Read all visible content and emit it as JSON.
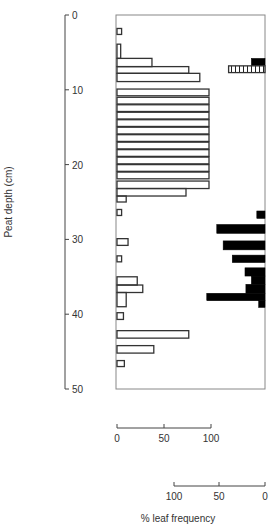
{
  "chart_data": {
    "type": "bar",
    "orientation": "horizontal",
    "title": "",
    "ylabel": "Peat depth (cm)",
    "xlabel": "% leaf frequency",
    "ylim": [
      0,
      50
    ],
    "y_ticks": [
      0,
      10,
      20,
      30,
      40,
      50
    ],
    "y_inverted": true,
    "grid": false,
    "series": [
      {
        "name": "open-bars (left scale, 0 to 100)",
        "style": "open",
        "scale": {
          "ticks": [
            0,
            50,
            100
          ],
          "direction": "left-to-right"
        },
        "bars": [
          {
            "depth": [
              1.8,
              2.6
            ],
            "value": 5
          },
          {
            "depth": [
              3.9,
              5.8
            ],
            "value": 4
          },
          {
            "depth": [
              5.8,
              6.9
            ],
            "value": 38
          },
          {
            "depth": [
              6.9,
              7.8
            ],
            "value": 78
          },
          {
            "depth": [
              7.8,
              8.9
            ],
            "value": 90
          },
          {
            "depth": [
              9.9,
              10.8
            ],
            "value": 100
          },
          {
            "depth": [
              11.0,
              11.9
            ],
            "value": 100
          },
          {
            "depth": [
              12.0,
              12.9
            ],
            "value": 100
          },
          {
            "depth": [
              13.0,
              13.9
            ],
            "value": 100
          },
          {
            "depth": [
              14.0,
              14.9
            ],
            "value": 100
          },
          {
            "depth": [
              15.0,
              15.9
            ],
            "value": 100
          },
          {
            "depth": [
              16.0,
              16.9
            ],
            "value": 100
          },
          {
            "depth": [
              17.0,
              17.9
            ],
            "value": 100
          },
          {
            "depth": [
              18.0,
              18.9
            ],
            "value": 100
          },
          {
            "depth": [
              19.0,
              19.9
            ],
            "value": 100
          },
          {
            "depth": [
              20.0,
              20.9
            ],
            "value": 100
          },
          {
            "depth": [
              21.0,
              21.9
            ],
            "value": 100
          },
          {
            "depth": [
              22.2,
              23.2
            ],
            "value": 100
          },
          {
            "depth": [
              23.2,
              24.2
            ],
            "value": 75
          },
          {
            "depth": [
              24.2,
              25.0
            ],
            "value": 10
          },
          {
            "depth": [
              26.0,
              26.8
            ],
            "value": 5
          },
          {
            "depth": [
              29.9,
              30.8
            ],
            "value": 12
          },
          {
            "depth": [
              32.2,
              33.0
            ],
            "value": 5
          },
          {
            "depth": [
              35.0,
              36.1
            ],
            "value": 22
          },
          {
            "depth": [
              36.1,
              37.1
            ],
            "value": 28
          },
          {
            "depth": [
              37.1,
              39.0
            ],
            "value": 10
          },
          {
            "depth": [
              39.8,
              40.7
            ],
            "value": 7
          },
          {
            "depth": [
              42.2,
              43.2
            ],
            "value": 78
          },
          {
            "depth": [
              44.2,
              45.2
            ],
            "value": 40
          },
          {
            "depth": [
              46.2,
              47.0
            ],
            "value": 8
          }
        ]
      },
      {
        "name": "filled-bars (right scale, 100 to 0)",
        "style": "solid",
        "scale": {
          "ticks": [
            100,
            50,
            0
          ],
          "direction": "right-to-left"
        },
        "bars": [
          {
            "depth": [
              5.8,
              6.8
            ],
            "value": 15
          },
          {
            "depth": [
              26.2,
              27.2
            ],
            "value": 9
          },
          {
            "depth": [
              28.0,
              29.2
            ],
            "value": 53
          },
          {
            "depth": [
              30.2,
              31.4
            ],
            "value": 46
          },
          {
            "depth": [
              32.1,
              33.1
            ],
            "value": 36
          },
          {
            "depth": [
              33.8,
              34.9
            ],
            "value": 22
          },
          {
            "depth": [
              34.9,
              36.0
            ],
            "value": 15
          },
          {
            "depth": [
              36.0,
              37.2
            ],
            "value": 21
          },
          {
            "depth": [
              37.2,
              38.2
            ],
            "value": 64
          },
          {
            "depth": [
              38.2,
              39.1
            ],
            "value": 7
          }
        ]
      },
      {
        "name": "hatched-bars (right scale, 100 to 0)",
        "style": "hatched",
        "scale": {
          "ticks": [
            100,
            50,
            0
          ],
          "direction": "right-to-left"
        },
        "bars": [
          {
            "depth": [
              6.8,
              7.7
            ],
            "value": 40
          }
        ]
      }
    ]
  },
  "labels": {
    "y_axis_title": "Peat depth (cm)",
    "x_axis_title": "% leaf frequency",
    "y_ticks": [
      "0",
      "10",
      "20",
      "30",
      "40",
      "50"
    ],
    "scale1_ticks": [
      "0",
      "50",
      "100"
    ],
    "scale2_ticks": [
      "100",
      "50",
      "0"
    ]
  },
  "colors": {
    "line": "#333333",
    "fill": "#000000",
    "background": "#ffffff"
  }
}
